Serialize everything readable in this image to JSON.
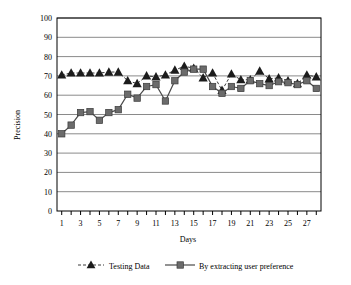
{
  "chart_data": {
    "type": "line",
    "title": "",
    "xlabel": "Days",
    "ylabel": "Precision",
    "xlim": [
      0.5,
      28.5
    ],
    "ylim": [
      0,
      100
    ],
    "ytick_step": 10,
    "yticks": [
      0,
      10,
      20,
      30,
      40,
      50,
      60,
      70,
      80,
      90,
      100
    ],
    "ytick_labels": [
      "0",
      "10",
      "20",
      "30",
      "40",
      "50",
      "60",
      "70",
      "80",
      "90",
      "100"
    ],
    "x": [
      1,
      2,
      3,
      4,
      5,
      6,
      7,
      8,
      9,
      10,
      11,
      12,
      13,
      14,
      15,
      16,
      17,
      18,
      19,
      20,
      21,
      22,
      23,
      24,
      25,
      26,
      27,
      28
    ],
    "xtick_labels": [
      "1",
      "",
      "3",
      "",
      "5",
      "",
      "7",
      "",
      "9",
      "",
      "11",
      "",
      "13",
      "",
      "15",
      "",
      "17",
      "",
      "19",
      "",
      "21",
      "",
      "23",
      "",
      "25",
      "",
      "27",
      ""
    ],
    "grid": "horizontal",
    "legend_position": "bottom",
    "series": [
      {
        "name": "Testing Data",
        "marker": "triangle",
        "linestyle": "dashed",
        "color": "#1c1c1c",
        "values": [
          70.5,
          71.5,
          71.5,
          71.5,
          71.5,
          72.0,
          72.0,
          67.5,
          66.0,
          70.0,
          69.5,
          70.5,
          73.0,
          75.0,
          74.0,
          69.0,
          71.5,
          62.5,
          71.0,
          68.0,
          68.0,
          72.5,
          68.5,
          69.0,
          67.5,
          66.0,
          70.5,
          69.5
        ]
      },
      {
        "name": "By extracting user preference",
        "marker": "square",
        "linestyle": "solid",
        "color": "#6b6b6b",
        "values": [
          40.0,
          44.5,
          51.0,
          51.5,
          47.0,
          51.0,
          52.5,
          60.5,
          58.5,
          64.5,
          65.5,
          57.0,
          67.5,
          72.0,
          73.5,
          73.5,
          64.5,
          61.0,
          64.5,
          63.5,
          67.5,
          66.0,
          65.0,
          67.0,
          66.5,
          65.5,
          67.5,
          63.5
        ]
      }
    ]
  },
  "axes": {
    "xlabel": "Days",
    "ylabel": "Precision"
  },
  "legend": {
    "items": [
      {
        "label": "Testing Data",
        "marker": "triangle-marker",
        "line": "dashed-line"
      },
      {
        "label": "By extracting user preference",
        "marker": "square-marker",
        "line": "solid-line"
      }
    ]
  }
}
